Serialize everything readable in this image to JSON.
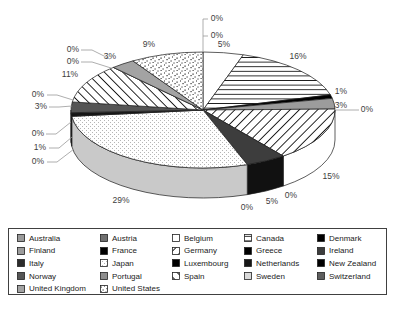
{
  "background": "#ffffff",
  "chart_data": {
    "type": "pie",
    "projection": "3d",
    "unit": "%",
    "start_angle": "12-o'clock, clockwise, alphabetical order",
    "legend_position": "bottom",
    "legend_columns": 5,
    "series": [
      {
        "name": "Australia",
        "value": 0,
        "label": "0%",
        "fill": "#9a9a9a",
        "pattern": "solid"
      },
      {
        "name": "Austria",
        "value": 0,
        "label": "0%",
        "fill": "#6f6f6f",
        "pattern": "solid"
      },
      {
        "name": "Belgium",
        "value": 5,
        "label": "5%",
        "fill": "#ffffff",
        "pattern": "solid"
      },
      {
        "name": "Canada",
        "value": 16,
        "label": "16%",
        "fill": "#ffffff",
        "pattern": "hlines"
      },
      {
        "name": "Denmark",
        "value": 1,
        "label": "1%",
        "fill": "#000000",
        "pattern": "solid"
      },
      {
        "name": "Finland",
        "value": 3,
        "label": "3%",
        "fill": "#9c9c9c",
        "pattern": "solid"
      },
      {
        "name": "France",
        "value": 0,
        "label": "0%",
        "fill": "#000000",
        "pattern": "solid"
      },
      {
        "name": "Germany",
        "value": 15,
        "label": "15%",
        "fill": "#ffffff",
        "pattern": "diag-up",
        "rim": "#ffffff"
      },
      {
        "name": "Greece",
        "value": 0,
        "label": "0%",
        "fill": "#000000",
        "pattern": "solid"
      },
      {
        "name": "Ireland",
        "value": 5,
        "label": "5%",
        "fill": "#3d3d3d",
        "pattern": "solid",
        "rim": "#111111"
      },
      {
        "name": "Italy",
        "value": 0,
        "label": "0%",
        "fill": "#2b2b2b",
        "pattern": "solid"
      },
      {
        "name": "Japan",
        "value": 29,
        "label": "29%",
        "fill": "#ffffff",
        "pattern": "fine-dot",
        "rim": "#c9c9c9"
      },
      {
        "name": "Luxembourg",
        "value": 0,
        "label": "0%",
        "fill": "#000000",
        "pattern": "solid"
      },
      {
        "name": "Netherlands",
        "value": 1,
        "label": "1%",
        "fill": "#161616",
        "pattern": "solid",
        "rim": "#000000"
      },
      {
        "name": "New Zealand",
        "value": 0,
        "label": "0%",
        "fill": "#000000",
        "pattern": "solid"
      },
      {
        "name": "Norway",
        "value": 3,
        "label": "3%",
        "fill": "#555555",
        "pattern": "solid"
      },
      {
        "name": "Portugal",
        "value": 0,
        "label": "0%",
        "fill": "#8d8d8d",
        "pattern": "solid"
      },
      {
        "name": "Spain",
        "value": 11,
        "label": "11%",
        "fill": "#ffffff",
        "pattern": "diag-down"
      },
      {
        "name": "Sweden",
        "value": 0,
        "label": "0%",
        "fill": "#d9d9d9",
        "pattern": "solid"
      },
      {
        "name": "Switzerland",
        "value": 0,
        "label": "0%",
        "fill": "#5e5e5e",
        "pattern": "solid"
      },
      {
        "name": "United Kingdom",
        "value": 3,
        "label": "3%",
        "fill": "#a3a3a3",
        "pattern": "solid"
      },
      {
        "name": "United States",
        "value": 9,
        "label": "9%",
        "fill": "#ffffff",
        "pattern": "stipple"
      }
    ]
  }
}
